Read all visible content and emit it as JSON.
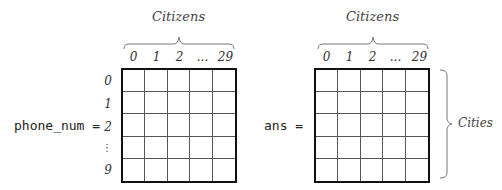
{
  "left_matrix": {
    "variable": "phone_num =",
    "column_title": "Citizens",
    "column_ticks": [
      "0",
      "1",
      "2",
      "...",
      "29"
    ],
    "row_ticks": [
      "0",
      "1",
      "2",
      "⋮",
      "9"
    ]
  },
  "right_matrix": {
    "variable": "ans =",
    "column_title": "Citizens",
    "column_ticks": [
      "0",
      "1",
      "2",
      "...",
      "29"
    ],
    "row_title": "Cities"
  }
}
